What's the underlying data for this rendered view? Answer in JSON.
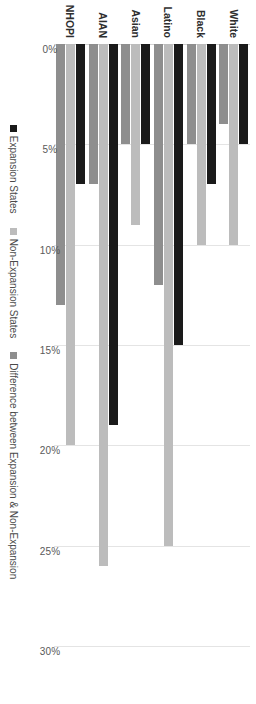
{
  "chart_data": {
    "type": "bar",
    "orientation": "horizontal",
    "title": "",
    "xlabel": "",
    "ylabel": "",
    "categories": [
      "White",
      "Black",
      "Latino",
      "Asian",
      "AIAN",
      "NHOPI"
    ],
    "series": [
      {
        "name": "Expansion States",
        "color": "#1a1a1a",
        "values": [
          5,
          7,
          15,
          5,
          19,
          7
        ]
      },
      {
        "name": "Non-Expansion States",
        "color": "#bcbcbc",
        "values": [
          10,
          10,
          25,
          9,
          26,
          20
        ]
      },
      {
        "name": "Difference between Expansion & Non-Expansion",
        "color": "#8e8e8e",
        "values": [
          4,
          5,
          12,
          5,
          7,
          13
        ]
      }
    ],
    "value_axis": {
      "ticks": [
        0,
        5,
        10,
        15,
        20,
        25,
        30
      ],
      "tick_labels": [
        "0%",
        "5%",
        "10%",
        "15%",
        "20%",
        "25%",
        "30%"
      ],
      "min": 0,
      "max": 30,
      "grid": true
    },
    "legend": {
      "position": "bottom",
      "entries": [
        "Expansion States",
        "Non-Expansion States",
        "Difference between Expansion & Non-Expansion"
      ]
    }
  }
}
